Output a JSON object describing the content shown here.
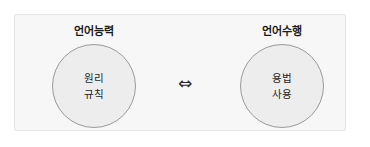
{
  "figure": {
    "name": "linguistic-competence-performance-diagram",
    "frame": {
      "fill": "#f7f7f7",
      "border_color": "#e4e4e4"
    },
    "nodes": [
      {
        "id": "competence",
        "label": "언어능력",
        "lines": [
          "원리",
          "규칙"
        ],
        "circle_fill": "#ededed",
        "circle_border": "#9a9a9a"
      },
      {
        "id": "performance",
        "label": "언어수행",
        "lines": [
          "용법",
          "사용"
        ],
        "circle_fill": "#ededed",
        "circle_border": "#9a9a9a"
      }
    ],
    "relation": {
      "symbol": "⇔",
      "icon_name": "left-right-double-arrow-icon"
    }
  }
}
